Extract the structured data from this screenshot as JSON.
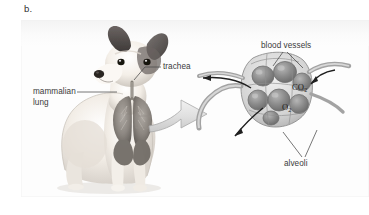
{
  "figure": {
    "letter": "b.",
    "caption_labels": {
      "mammalian_lung": "mammalian lung",
      "trachea": "trachea",
      "blood_vessels": "blood vessels",
      "alveoli": "alveoli",
      "carbon_dioxide": "CO",
      "carbon_dioxide_sub": "2",
      "oxygen": "O",
      "oxygen_sub": "2"
    },
    "subjects": {
      "animal": "jack-russell-terrier-dog",
      "organ_overlay": "mammalian-lungs",
      "inset": "alveolar-cluster-cross-section",
      "magnify_arrow": "curved-block-arrow"
    },
    "colors": {
      "label_text": "#3b3b3b",
      "gas_text": "#1d1d1d",
      "leader_line": "#4a4a4a",
      "panel_background": "#fdfdfd",
      "arrow_fill": "#e2e2e2",
      "arrow_stroke": "#9a9a9a",
      "alveoli_sac": "#8d8d8d",
      "vessel_stroke": "#6a6a6a",
      "dog_light": "#f3efe9",
      "dog_dark": "#4a4644",
      "lung_tissue": "#8a8580"
    }
  }
}
